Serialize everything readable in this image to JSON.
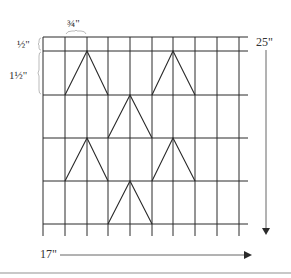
{
  "labels": {
    "column_width": "¾\"",
    "top_row_height": "½\"",
    "row_height": "1½\"",
    "total_height": "25\"",
    "total_width": "17\""
  },
  "grid": {
    "columns": 9,
    "rows": 5,
    "column_width_in": 0.75,
    "top_row_height_in": 0.5,
    "row_height_in": 1.5
  },
  "triangles": [
    {
      "row": 1,
      "apex_col_line": 2,
      "base_from": 1,
      "base_to": 3
    },
    {
      "row": 1,
      "apex_col_line": 6,
      "base_from": 5,
      "base_to": 7
    },
    {
      "row": 2,
      "apex_col_line": 4,
      "base_from": 3,
      "base_to": 5
    },
    {
      "row": 3,
      "apex_col_line": 2,
      "base_from": 1,
      "base_to": 3
    },
    {
      "row": 3,
      "apex_col_line": 6,
      "base_from": 5,
      "base_to": 7
    },
    {
      "row": 4,
      "apex_col_line": 4,
      "base_from": 3,
      "base_to": 5
    }
  ],
  "colors": {
    "line": "#2a2a2a",
    "arrow": "#555555",
    "brace": "#aaaaaa",
    "label": "#333333"
  }
}
